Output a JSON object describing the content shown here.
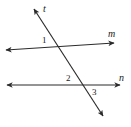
{
  "figure": {
    "type": "geometry-diagram",
    "width": 131,
    "height": 127,
    "background_color": "#ffffff",
    "stroke_color": "#2b2b2b",
    "label_color": "#1a1a1a",
    "lines": [
      {
        "id": "line-t",
        "label": "t",
        "label_x": 43,
        "label_y": 4,
        "x1": 34,
        "y1": 9,
        "x2": 103,
        "y2": 116,
        "arrow_start": true,
        "arrow_end": true
      },
      {
        "id": "line-m",
        "label": "m",
        "label_x": 108,
        "label_y": 29,
        "x1": 6,
        "y1": 50,
        "x2": 114,
        "y2": 43,
        "arrow_start": true,
        "arrow_end": true
      },
      {
        "id": "line-n",
        "label": "n",
        "label_x": 119,
        "label_y": 73,
        "x1": 7,
        "y1": 85,
        "x2": 120,
        "y2": 85,
        "arrow_start": true,
        "arrow_end": true
      }
    ],
    "intersections": [
      {
        "id": "intersection-t-m",
        "x": 56,
        "y": 47
      },
      {
        "id": "intersection-t-n",
        "x": 85,
        "y": 85
      }
    ],
    "angles": [
      {
        "id": "angle-1",
        "label": "1",
        "label_x": 42,
        "label_y": 36
      },
      {
        "id": "angle-2",
        "label": "2",
        "label_x": 66,
        "label_y": 74
      },
      {
        "id": "angle-3",
        "label": "3",
        "label_x": 92,
        "label_y": 88
      }
    ]
  }
}
